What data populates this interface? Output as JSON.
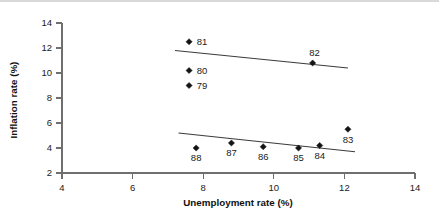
{
  "chart_data": {
    "type": "scatter",
    "title": "",
    "xlabel": "Unemployment rate (%)",
    "ylabel": "Inflation rate (%)",
    "xlim": [
      4,
      14
    ],
    "ylim": [
      2,
      14
    ],
    "xticks": [
      "4",
      "6",
      "8",
      "10",
      "12",
      "14"
    ],
    "yticks": [
      "2",
      "4",
      "6",
      "8",
      "10",
      "12",
      "14"
    ],
    "grid": false,
    "legend": "none",
    "series": [
      {
        "name": "1979-1982",
        "points": [
          {
            "label": "81",
            "x": 7.6,
            "y": 12.5
          },
          {
            "label": "80",
            "x": 7.6,
            "y": 10.2
          },
          {
            "label": "79",
            "x": 7.6,
            "y": 9.0
          },
          {
            "label": "82",
            "x": 11.1,
            "y": 10.8
          }
        ],
        "trendline": {
          "x1": 7.2,
          "y1": 11.8,
          "x2": 12.1,
          "y2": 10.4
        }
      },
      {
        "name": "1983-1988",
        "points": [
          {
            "label": "88",
            "x": 7.8,
            "y": 4.0
          },
          {
            "label": "87",
            "x": 8.8,
            "y": 4.4
          },
          {
            "label": "86",
            "x": 9.7,
            "y": 4.1
          },
          {
            "label": "85",
            "x": 10.7,
            "y": 4.0
          },
          {
            "label": "84",
            "x": 11.3,
            "y": 4.2
          },
          {
            "label": "83",
            "x": 12.1,
            "y": 5.5
          }
        ],
        "trendline": {
          "x1": 7.3,
          "y1": 5.2,
          "x2": 12.3,
          "y2": 3.7
        }
      }
    ]
  },
  "colors": {
    "axis": "#6f6f6f",
    "marker": "#141414",
    "trendline": "#3b3b3b",
    "text": "#1a1a1a",
    "background": "#ffffff",
    "top_rule": "#d9d9d9"
  }
}
